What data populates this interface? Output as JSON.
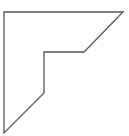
{
  "diagram": {
    "shape": "polygon",
    "stroke_color": "#555555",
    "fill_color": "#ffffff",
    "stroke_width": 1.3,
    "points": [
      [
        4,
        12
      ],
      [
        123,
        12
      ],
      [
        84,
        52
      ],
      [
        44,
        52
      ],
      [
        44,
        93
      ],
      [
        4,
        133
      ]
    ]
  }
}
